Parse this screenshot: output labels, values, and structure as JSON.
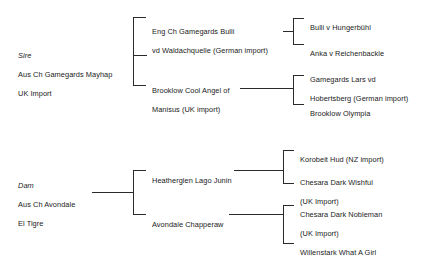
{
  "diagram": {
    "type": "pedigree-chart",
    "title": "",
    "generations": 3,
    "line_color": "#2a2a2a",
    "background_color": "#ffffff",
    "text_color": "#1b1b1b"
  },
  "sire": {
    "role_label": "Sire",
    "name_line_1": "Aus Ch Gamegards Mayhap",
    "name_line_2": "UK Import",
    "children": [
      {
        "name_line_1": "Eng Ch Gamegards Bulli",
        "name_line_2": "vd Waldachquelle (German import)",
        "children": [
          {
            "name_line_1": "Bulli v Hungerbühl",
            "name_line_2": ""
          },
          {
            "name_line_1": "Anka v Reichenbackle",
            "name_line_2": ""
          }
        ]
      },
      {
        "name_line_1": "Brooklow Cool Angel of",
        "name_line_2": "Manisus (UK import)",
        "children": [
          {
            "name_line_1": "Gamegards Lars vd",
            "name_line_2": "Hobertsberg (German import)"
          },
          {
            "name_line_1": "Brooklow Olympia",
            "name_line_2": ""
          }
        ]
      }
    ]
  },
  "dam": {
    "role_label": "Dam",
    "name_line_1": "Aus Ch Avondale",
    "name_line_2": "El Tigre",
    "children": [
      {
        "name_line_1": "Heatherglen Lago Junin",
        "name_line_2": "",
        "children": [
          {
            "name_line_1": "Korobeit Hud (NZ import)",
            "name_line_2": ""
          },
          {
            "name_line_1": "Chesara Dark Wishful",
            "name_line_2": "(UK Import)"
          }
        ]
      },
      {
        "name_line_1": "Avondale Chapperaw",
        "name_line_2": "",
        "children": [
          {
            "name_line_1": "Chesara Dark Nobleman",
            "name_line_2": "(UK Import)"
          },
          {
            "name_line_1": "Willenstark What A Girl",
            "name_line_2": ""
          }
        ]
      }
    ]
  }
}
